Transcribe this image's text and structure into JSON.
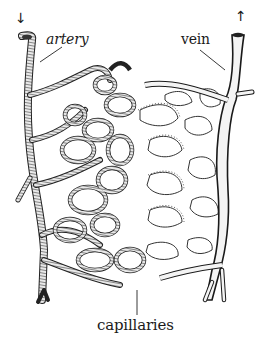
{
  "diagram": {
    "labels": {
      "artery": "artery",
      "vein": "vein",
      "capillaries": "capillaries"
    },
    "arrows": {
      "artery_flow": "↓",
      "vein_flow": "↑"
    },
    "colors": {
      "ink": "#1a1a1a",
      "artery_shading": "#5a5a5a",
      "vein_fill": "#f4f4f4",
      "background": "#ffffff"
    }
  }
}
